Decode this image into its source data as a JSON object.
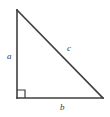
{
  "figure": {
    "kind": "right-triangle-diagram",
    "background_color": "#ffffff",
    "stroke_color": "#3f3f3f",
    "label_color": "#3a3a3a",
    "canvas": {
      "width": 110,
      "height": 117
    },
    "vertices": {
      "top": {
        "x": 17,
        "y": 10
      },
      "bottom_left": {
        "x": 17,
        "y": 98
      },
      "bottom_right": {
        "x": 103,
        "y": 98
      }
    },
    "right_angle_marker": {
      "present": true,
      "at_vertex": "bottom_left",
      "size": 8
    },
    "labels": {
      "leg_vertical": "a",
      "leg_horizontal": "b",
      "hypotenuse": "c"
    }
  }
}
